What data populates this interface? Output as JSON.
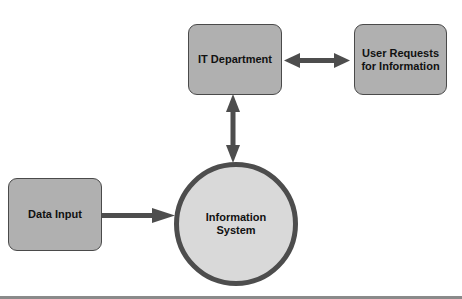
{
  "diagram": {
    "nodes": {
      "it_department": {
        "label": "IT Department"
      },
      "user_requests": {
        "label_line1": "User Requests",
        "label_line2": "for Information"
      },
      "data_input": {
        "label": "Data Input"
      },
      "information_system": {
        "label_line1": "Information",
        "label_line2": "System"
      }
    },
    "edges": [
      {
        "from": "IT Department",
        "to": "User Requests for Information",
        "type": "bidirectional"
      },
      {
        "from": "IT Department",
        "to": "Information System",
        "type": "bidirectional"
      },
      {
        "from": "Data Input",
        "to": "Information System",
        "type": "directed"
      }
    ],
    "colors": {
      "box_fill": "#b0b0b0",
      "circle_fill": "#d9d9d9",
      "stroke": "#4d4d4d"
    }
  }
}
